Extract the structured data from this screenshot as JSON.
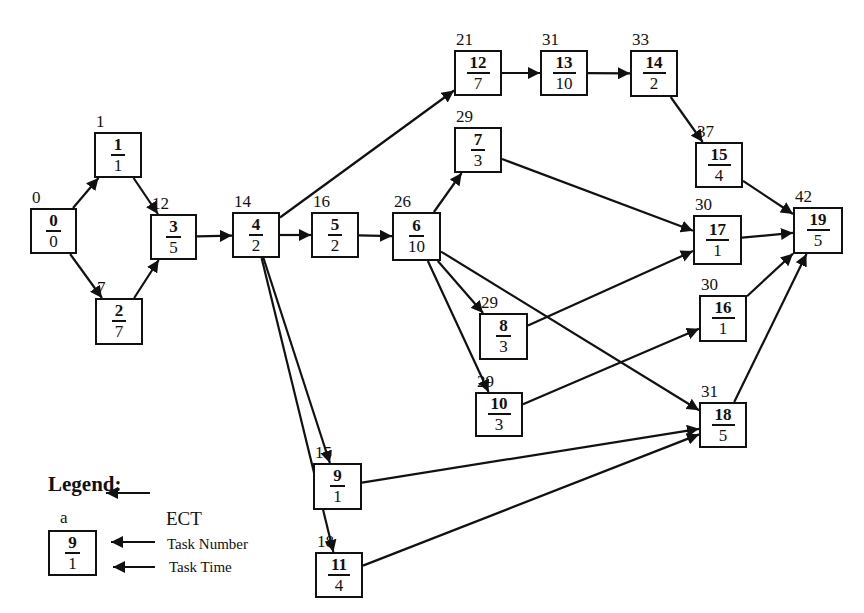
{
  "diagram": {
    "type": "precedence-network",
    "nodes": [
      {
        "id": "0",
        "task": "0",
        "time": "0",
        "ect": "0",
        "x": 30,
        "y": 208,
        "w": 47,
        "h": 46
      },
      {
        "id": "1",
        "task": "1",
        "time": "1",
        "ect": "1",
        "x": 94,
        "y": 132,
        "w": 48,
        "h": 46
      },
      {
        "id": "2",
        "task": "2",
        "time": "7",
        "ect": "7",
        "x": 95,
        "y": 298,
        "w": 48,
        "h": 47
      },
      {
        "id": "3",
        "task": "3",
        "time": "5",
        "ect": "12",
        "x": 150,
        "y": 214,
        "w": 47,
        "h": 46
      },
      {
        "id": "4",
        "task": "4",
        "time": "2",
        "ect": "14",
        "x": 232,
        "y": 212,
        "w": 48,
        "h": 46
      },
      {
        "id": "5",
        "task": "5",
        "time": "2",
        "ect": "16",
        "x": 311,
        "y": 212,
        "w": 48,
        "h": 46
      },
      {
        "id": "6",
        "task": "6",
        "time": "10",
        "ect": "26",
        "x": 392,
        "y": 212,
        "w": 49,
        "h": 49
      },
      {
        "id": "12",
        "task": "12",
        "time": "7",
        "ect": "21",
        "x": 454,
        "y": 50,
        "w": 48,
        "h": 46
      },
      {
        "id": "13",
        "task": "13",
        "time": "10",
        "ect": "31",
        "x": 540,
        "y": 50,
        "w": 48,
        "h": 46
      },
      {
        "id": "14",
        "task": "14",
        "time": "2",
        "ect": "33",
        "x": 630,
        "y": 50,
        "w": 48,
        "h": 47
      },
      {
        "id": "7",
        "task": "7",
        "time": "3",
        "ect": "29",
        "x": 454,
        "y": 127,
        "w": 48,
        "h": 46
      },
      {
        "id": "15",
        "task": "15",
        "time": "4",
        "ect": "37",
        "x": 695,
        "y": 142,
        "w": 48,
        "h": 46
      },
      {
        "id": "17",
        "task": "17",
        "time": "1",
        "ect": "30",
        "x": 693,
        "y": 215,
        "w": 49,
        "h": 50
      },
      {
        "id": "19",
        "task": "19",
        "time": "5",
        "ect": "42",
        "x": 793,
        "y": 207,
        "w": 50,
        "h": 47
      },
      {
        "id": "8",
        "task": "8",
        "time": "3",
        "ect": "29",
        "x": 479,
        "y": 313,
        "w": 49,
        "h": 47
      },
      {
        "id": "16",
        "task": "16",
        "time": "1",
        "ect": "30",
        "x": 699,
        "y": 295,
        "w": 48,
        "h": 47
      },
      {
        "id": "10",
        "task": "10",
        "time": "3",
        "ect": "29",
        "x": 475,
        "y": 392,
        "w": 48,
        "h": 45
      },
      {
        "id": "18",
        "task": "18",
        "time": "5",
        "ect": "31",
        "x": 699,
        "y": 402,
        "w": 48,
        "h": 46
      },
      {
        "id": "9",
        "task": "9",
        "time": "1",
        "ect": "15",
        "x": 313,
        "y": 463,
        "w": 49,
        "h": 47
      },
      {
        "id": "11",
        "task": "11",
        "time": "4",
        "ect": "18",
        "x": 315,
        "y": 552,
        "w": 48,
        "h": 46
      }
    ],
    "edges": [
      [
        "0",
        "1"
      ],
      [
        "0",
        "2"
      ],
      [
        "1",
        "3"
      ],
      [
        "2",
        "3"
      ],
      [
        "3",
        "4"
      ],
      [
        "4",
        "12"
      ],
      [
        "4",
        "5"
      ],
      [
        "4",
        "9"
      ],
      [
        "4",
        "11"
      ],
      [
        "5",
        "6"
      ],
      [
        "6",
        "7"
      ],
      [
        "6",
        "8"
      ],
      [
        "6",
        "10"
      ],
      [
        "6",
        "18"
      ],
      [
        "12",
        "13"
      ],
      [
        "13",
        "14"
      ],
      [
        "14",
        "15"
      ],
      [
        "15",
        "19"
      ],
      [
        "7",
        "17"
      ],
      [
        "8",
        "17"
      ],
      [
        "17",
        "19"
      ],
      [
        "10",
        "16"
      ],
      [
        "16",
        "19"
      ],
      [
        "9",
        "18"
      ],
      [
        "11",
        "18"
      ],
      [
        "18",
        "19"
      ]
    ]
  },
  "legend": {
    "title": "Legend:",
    "sample": {
      "ect": "a",
      "task": "9",
      "time": "1"
    },
    "labels": {
      "ect": "ECT",
      "task_number": "Task Number",
      "task_time": "Task Time"
    }
  }
}
